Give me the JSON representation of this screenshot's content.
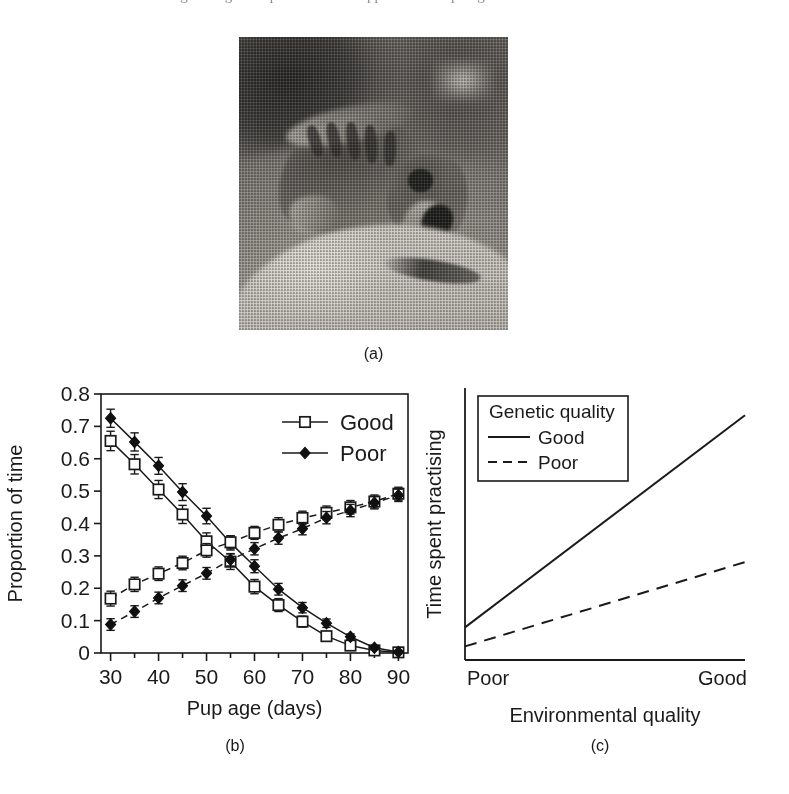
{
  "top_sliver": {
    "text": "the original figure caption line is cropped at the top edge"
  },
  "panels": {
    "a": {
      "caption": "(a)",
      "alt_name": "meerkat-pup-photograph"
    },
    "b": {
      "caption": "(b)"
    },
    "c": {
      "caption": "(c)"
    }
  },
  "chart_data": [
    {
      "id": "panel-b",
      "type": "line",
      "title": "",
      "xlabel": "Pup age (days)",
      "ylabel": "Proportion of time",
      "xlim": [
        28,
        92
      ],
      "ylim": [
        0,
        0.8
      ],
      "xticks": [
        30,
        40,
        50,
        60,
        70,
        80,
        90
      ],
      "xtick_labels": [
        "30",
        "40",
        "50",
        "60",
        "70",
        "80",
        "90"
      ],
      "minor_xtick_step": 5,
      "yticks": [
        0,
        0.1,
        0.2,
        0.3,
        0.4,
        0.5,
        0.6,
        0.7,
        0.8
      ],
      "ytick_labels": [
        "0",
        "0.1",
        "0.2",
        "0.3",
        "0.4",
        "0.5",
        "0.6",
        "0.7",
        "0.8"
      ],
      "grid": false,
      "legend_position": "top-right",
      "legend_entries": [
        {
          "label": "Good",
          "marker": "open-square",
          "line": "solid"
        },
        {
          "label": "Poor",
          "marker": "filled-diamond",
          "line": "solid"
        }
      ],
      "x": [
        30,
        35,
        40,
        45,
        50,
        55,
        60,
        65,
        70,
        75,
        80,
        85,
        90
      ],
      "series": [
        {
          "name": "Good-descending",
          "marker": "open-square",
          "line": "solid",
          "values": [
            0.655,
            0.583,
            0.505,
            0.428,
            0.345,
            0.282,
            0.205,
            0.148,
            0.097,
            0.052,
            0.023,
            0.008,
            0.002
          ],
          "errors": [
            0.03,
            0.03,
            0.028,
            0.028,
            0.026,
            0.024,
            0.022,
            0.02,
            0.017,
            0.014,
            0.01,
            0.006,
            0.004
          ]
        },
        {
          "name": "Poor-descending",
          "marker": "filled-diamond",
          "line": "solid",
          "values": [
            0.725,
            0.652,
            0.578,
            0.497,
            0.423,
            0.34,
            0.268,
            0.197,
            0.14,
            0.092,
            0.05,
            0.016,
            0.003
          ],
          "errors": [
            0.028,
            0.028,
            0.026,
            0.026,
            0.024,
            0.022,
            0.02,
            0.018,
            0.016,
            0.013,
            0.009,
            0.006,
            0.004
          ]
        },
        {
          "name": "Good-ascending",
          "marker": "open-square",
          "line": "dashed",
          "values": [
            0.168,
            0.212,
            0.245,
            0.278,
            0.317,
            0.342,
            0.371,
            0.396,
            0.417,
            0.433,
            0.45,
            0.468,
            0.492
          ],
          "errors": [
            0.023,
            0.022,
            0.021,
            0.021,
            0.021,
            0.02,
            0.02,
            0.022,
            0.021,
            0.021,
            0.021,
            0.02,
            0.02
          ]
        },
        {
          "name": "Poor-ascending",
          "marker": "filled-diamond",
          "line": "dashed",
          "values": [
            0.088,
            0.128,
            0.17,
            0.208,
            0.246,
            0.288,
            0.322,
            0.355,
            0.384,
            0.418,
            0.44,
            0.464,
            0.487
          ],
          "errors": [
            0.018,
            0.018,
            0.018,
            0.018,
            0.018,
            0.019,
            0.019,
            0.019,
            0.019,
            0.019,
            0.019,
            0.019,
            0.019
          ]
        }
      ]
    },
    {
      "id": "panel-c",
      "type": "line",
      "title": "",
      "xlabel": "Environmental quality",
      "ylabel": "Time spent practising",
      "xtick_labels": [
        "Poor",
        "Good"
      ],
      "grid": false,
      "legend_title": "Genetic quality",
      "legend_position": "top-left-inset",
      "legend_entries": [
        {
          "label": "Good",
          "line": "solid"
        },
        {
          "label": "Poor",
          "line": "dashed"
        }
      ],
      "x": [
        0,
        1
      ],
      "series": [
        {
          "name": "Good",
          "line": "solid",
          "values": [
            0.12,
            0.9
          ]
        },
        {
          "name": "Poor",
          "line": "dashed",
          "values": [
            0.05,
            0.36
          ]
        }
      ]
    }
  ]
}
